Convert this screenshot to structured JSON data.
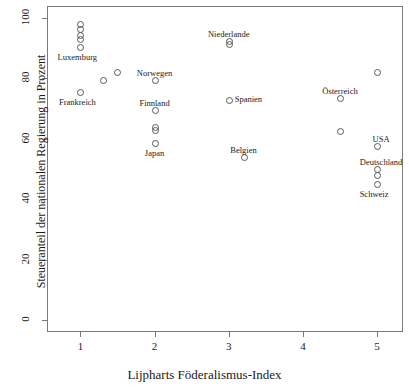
{
  "chart_data": {
    "type": "scatter",
    "title": "",
    "xlabel": "Lijpharts Föderalismus-Index",
    "ylabel": "Steueranteil der nationalen Regierung in Prozent",
    "xlim": [
      0.55,
      5.35
    ],
    "ylim": [
      -4,
      104
    ],
    "xticks": [
      1,
      2,
      3,
      4,
      5
    ],
    "yticks": [
      0,
      20,
      40,
      60,
      80,
      100
    ],
    "grid": false,
    "legend": "none",
    "marker": "open-circle",
    "marker_color": "#595959",
    "points": [
      {
        "x": 1.0,
        "y": 98.0,
        "label": ""
      },
      {
        "x": 1.0,
        "y": 96.5,
        "label": ""
      },
      {
        "x": 1.0,
        "y": 94.5,
        "label": ""
      },
      {
        "x": 1.0,
        "y": 93.0,
        "label": ""
      },
      {
        "x": 1.0,
        "y": 90.5,
        "label": "Luxemburg"
      },
      {
        "x": 1.0,
        "y": 75.5,
        "label": "Frankreich"
      },
      {
        "x": 1.3,
        "y": 79.5,
        "label": ""
      },
      {
        "x": 1.5,
        "y": 82.0,
        "label": ""
      },
      {
        "x": 2.0,
        "y": 79.5,
        "label": "Norwegen"
      },
      {
        "x": 2.0,
        "y": 69.5,
        "label": "Finnland"
      },
      {
        "x": 2.0,
        "y": 64.0,
        "label": ""
      },
      {
        "x": 2.0,
        "y": 63.0,
        "label": ""
      },
      {
        "x": 2.0,
        "y": 58.5,
        "label": "Japan"
      },
      {
        "x": 3.0,
        "y": 92.5,
        "label": "Niederlande"
      },
      {
        "x": 3.0,
        "y": 91.5,
        "label": ""
      },
      {
        "x": 3.0,
        "y": 73.0,
        "label": "Spanien"
      },
      {
        "x": 3.2,
        "y": 54.0,
        "label": "Belgien"
      },
      {
        "x": 4.5,
        "y": 73.5,
        "label": "Österreich"
      },
      {
        "x": 4.5,
        "y": 62.5,
        "label": ""
      },
      {
        "x": 5.0,
        "y": 82.0,
        "label": ""
      },
      {
        "x": 5.0,
        "y": 57.5,
        "label": "USA"
      },
      {
        "x": 5.0,
        "y": 50.0,
        "label": "Deutschland"
      },
      {
        "x": 5.0,
        "y": 48.0,
        "label": ""
      },
      {
        "x": 5.0,
        "y": 45.0,
        "label": "Schweiz"
      }
    ],
    "annotations": [
      {
        "text": "Luxemburg",
        "x": 1.0,
        "y": 90.5,
        "pos": "below-left"
      },
      {
        "text": "Frankreich",
        "x": 1.0,
        "y": 75.5,
        "pos": "below-left"
      },
      {
        "text": "Norwegen",
        "x": 2.0,
        "y": 79.5,
        "pos": "above"
      },
      {
        "text": "Finnland",
        "x": 2.0,
        "y": 69.5,
        "pos": "above"
      },
      {
        "text": "Japan",
        "x": 2.0,
        "y": 58.5,
        "pos": "below"
      },
      {
        "text": "Niederlande",
        "x": 3.0,
        "y": 92.5,
        "pos": "above"
      },
      {
        "text": "Spanien",
        "x": 3.0,
        "y": 73.0,
        "pos": "right"
      },
      {
        "text": "Belgien",
        "x": 3.2,
        "y": 54.0,
        "pos": "above"
      },
      {
        "text": "Österreich",
        "x": 4.5,
        "y": 73.5,
        "pos": "above"
      },
      {
        "text": "USA",
        "x": 5.0,
        "y": 57.5,
        "pos": "above-left"
      },
      {
        "text": "Deutschland",
        "x": 5.0,
        "y": 50.0,
        "pos": "above-left"
      },
      {
        "text": "Schweiz",
        "x": 5.0,
        "y": 45.0,
        "pos": "below-left"
      }
    ]
  },
  "axes": {
    "x_tick_labels": [
      "1",
      "2",
      "3",
      "4",
      "5"
    ],
    "y_tick_labels": [
      "0",
      "20",
      "40",
      "60",
      "80",
      "100"
    ],
    "x_title": "Lijpharts Föderalismus-Index",
    "y_title": "Steueranteil der nationalen Regierung in Prozent"
  }
}
